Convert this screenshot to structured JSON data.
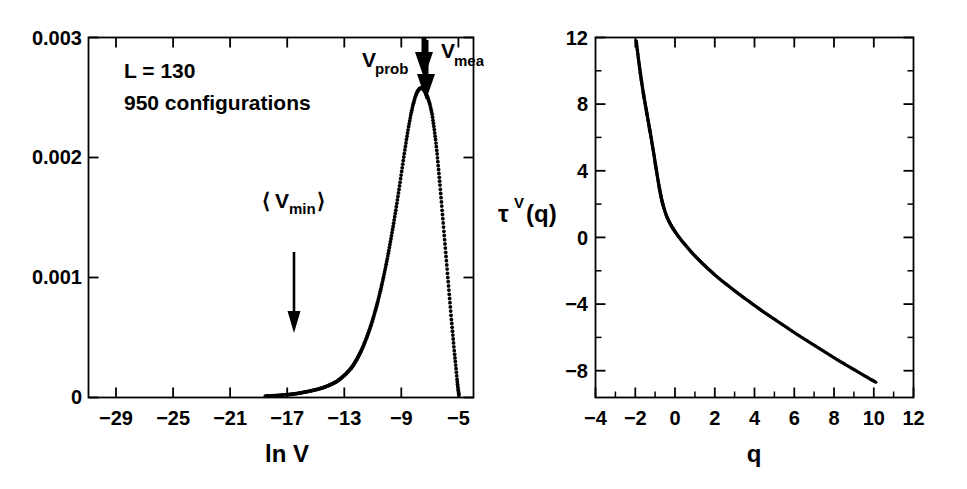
{
  "figure": {
    "background_color": "#ffffff",
    "ink_color": "#000000",
    "panel_count": 2
  },
  "chart_data": [
    {
      "id": "left-panel",
      "type": "scatter",
      "title": "",
      "xlabel": "ln V",
      "ylabel": "",
      "xlim": [
        -31,
        -4
      ],
      "ylim": [
        0,
        0.003
      ],
      "grid": false,
      "legend": "none",
      "xticks": [
        -29,
        -25,
        -21,
        -17,
        -13,
        -9,
        -5
      ],
      "xtick_labels": [
        "−29",
        "−25",
        "−21",
        "−17",
        "−13",
        "−9",
        "−5"
      ],
      "xticks_minor": [
        -27,
        -23,
        -19,
        -15,
        -11,
        -7
      ],
      "yticks": [
        0,
        0.001,
        0.002,
        0.003
      ],
      "ytick_labels": [
        "0",
        "0.001",
        "0.002",
        "0.003"
      ],
      "annotations": [
        {
          "name": "system-size",
          "text": "L = 130"
        },
        {
          "name": "sample-count",
          "text": "950 configurations"
        },
        {
          "name": "vmin-label",
          "text": "⟨V",
          "sub": "min",
          "text_end": "⟩"
        },
        {
          "name": "vprob-label",
          "text": "V",
          "sub": "prob"
        },
        {
          "name": "vmean-label",
          "text": "V",
          "sub": "mean"
        }
      ],
      "arrows": [
        {
          "name": "vmin-arrow",
          "x": -17.0,
          "y_from": 0.00122,
          "y_to": 0.00031,
          "style": "thin"
        },
        {
          "name": "vprob-arrow",
          "x": -7.35,
          "y_from": 0.003,
          "y_to": 0.00266,
          "style": "thick-short"
        },
        {
          "name": "vmean-arrow",
          "x": -7.2,
          "y_from": 0.00297,
          "y_to": 0.00253,
          "style": "thick-long"
        }
      ],
      "series": [
        {
          "name": "P(ln V)",
          "marker": "dot",
          "x": [
            -18.6,
            -18.2,
            -17.8,
            -17.4,
            -17.0,
            -16.7,
            -16.4,
            -16.1,
            -15.8,
            -15.5,
            -15.2,
            -14.9,
            -14.6,
            -14.35,
            -14.1,
            -13.85,
            -13.6,
            -13.4,
            -13.2,
            -13.0,
            -12.8,
            -12.6,
            -12.45,
            -12.3,
            -12.15,
            -12.0,
            -11.85,
            -11.7,
            -11.55,
            -11.4,
            -11.25,
            -11.1,
            -10.95,
            -10.8,
            -10.65,
            -10.5,
            -10.35,
            -10.2,
            -10.05,
            -9.9,
            -9.75,
            -9.6,
            -9.45,
            -9.3,
            -9.15,
            -9.0,
            -8.85,
            -8.7,
            -8.55,
            -8.4,
            -8.25,
            -8.1,
            -7.95,
            -7.8,
            -7.65,
            -7.5,
            -7.35,
            -7.2,
            -7.05,
            -6.9,
            -6.78,
            -6.66,
            -6.55,
            -6.45,
            -6.35,
            -6.25,
            -6.15,
            -6.05,
            -5.95,
            -5.85,
            -5.75,
            -5.65,
            -5.55,
            -5.45,
            -5.35,
            -5.25,
            -5.15,
            -5.08,
            -5.02
          ],
          "y": [
            1.2e-05,
            1.4e-05,
            1.7e-05,
            2.1e-05,
            2.4e-05,
            2.8e-05,
            3.3e-05,
            3.9e-05,
            4.6e-05,
            5.3e-05,
            6.1e-05,
            7e-05,
            8e-05,
            9.1e-05,
            0.000103,
            0.000117,
            0.000133,
            0.00015,
            0.00017,
            0.000191,
            0.000215,
            0.000242,
            0.000266,
            0.000295,
            0.000325,
            0.00036,
            0.000396,
            0.000437,
            0.000481,
            0.000529,
            0.00058,
            0.000636,
            0.000696,
            0.00076,
            0.000829,
            0.000903,
            0.000982,
            0.001066,
            0.001155,
            0.001249,
            0.001348,
            0.001452,
            0.001561,
            0.001675,
            0.001793,
            0.001914,
            0.002034,
            0.00215,
            0.002258,
            0.002354,
            0.002435,
            0.0025,
            0.002546,
            0.002573,
            0.00258,
            0.002568,
            0.00254,
            0.002497,
            0.00244,
            0.00236,
            0.00226,
            0.00215,
            0.00203,
            0.0019,
            0.00177,
            0.00163,
            0.00149,
            0.00135,
            0.00121,
            0.00107,
            0.00093,
            0.00079,
            0.00065,
            0.00052,
            0.00039,
            0.00027,
            0.00015,
            7e-05,
            2e-05
          ]
        }
      ]
    },
    {
      "id": "right-panel",
      "type": "scatter",
      "title": "",
      "xlabel": "q",
      "ylabel": "τ",
      "ylabel_super": "V",
      "ylabel_tail": "(q)",
      "xlim": [
        -4,
        12
      ],
      "ylim": [
        -9.6,
        12
      ],
      "grid": false,
      "legend": "none",
      "xticks": [
        -4,
        -2,
        0,
        2,
        4,
        6,
        8,
        10,
        12
      ],
      "xtick_labels": [
        "−4",
        "−2",
        "0",
        "2",
        "4",
        "6",
        "8",
        "10",
        "12"
      ],
      "xticks_minor": [
        -3,
        -1,
        1,
        3,
        5,
        7,
        9,
        11
      ],
      "yticks": [
        -8,
        -4,
        0,
        4,
        8,
        12
      ],
      "ytick_labels": [
        "−8",
        "−4",
        "0",
        "4",
        "8",
        "12"
      ],
      "yticks_minor": [
        -6,
        -2,
        2,
        6,
        10
      ],
      "series": [
        {
          "name": "tau^V(q)",
          "marker": "dot",
          "x": [
            -1.95,
            -1.9,
            -1.85,
            -1.8,
            -1.75,
            -1.7,
            -1.65,
            -1.6,
            -1.55,
            -1.5,
            -1.45,
            -1.4,
            -1.35,
            -1.3,
            -1.25,
            -1.2,
            -1.15,
            -1.1,
            -1.05,
            -1.0,
            -0.95,
            -0.9,
            -0.85,
            -0.8,
            -0.75,
            -0.7,
            -0.65,
            -0.6,
            -0.5,
            -0.4,
            -0.3,
            -0.2,
            -0.1,
            0.0,
            0.2,
            0.4,
            0.6,
            0.8,
            1.0,
            1.2,
            1.4,
            1.6,
            1.8,
            2.0,
            2.3,
            2.6,
            2.9,
            3.2,
            3.5,
            3.8,
            4.1,
            4.4,
            4.7,
            5.0,
            5.4,
            5.8,
            6.2,
            6.6,
            7.0,
            7.4,
            7.8,
            8.2,
            8.6,
            9.0,
            9.4,
            9.8,
            10.1
          ],
          "y": [
            11.8,
            11.3,
            10.82,
            10.36,
            9.92,
            9.5,
            9.1,
            8.72,
            8.36,
            8.02,
            7.68,
            7.34,
            7.0,
            6.66,
            6.32,
            5.98,
            5.62,
            5.26,
            4.9,
            4.52,
            4.14,
            3.76,
            3.4,
            3.06,
            2.74,
            2.44,
            2.18,
            1.94,
            1.54,
            1.22,
            0.96,
            0.74,
            0.54,
            0.36,
            0.02,
            -0.28,
            -0.56,
            -0.84,
            -1.1,
            -1.34,
            -1.58,
            -1.8,
            -2.02,
            -2.24,
            -2.54,
            -2.82,
            -3.1,
            -3.38,
            -3.64,
            -3.9,
            -4.16,
            -4.42,
            -4.66,
            -4.9,
            -5.22,
            -5.54,
            -5.86,
            -6.16,
            -6.46,
            -6.76,
            -7.06,
            -7.36,
            -7.64,
            -7.92,
            -8.2,
            -8.48,
            -8.68
          ]
        }
      ]
    }
  ],
  "labels": {
    "left": {
      "system_size": "L = 130",
      "config_count": "950 configurations",
      "vmin_open": "⟨",
      "vmin_base": "V",
      "vmin_sub": "min",
      "vmin_close": "⟩",
      "vprob_base": "V",
      "vprob_sub": "prob",
      "vmean_base": "V",
      "vmean_sub": "mean",
      "xaxis_title": "ln V",
      "ytick_0": "0",
      "ytick_1": "0.001",
      "ytick_2": "0.002",
      "ytick_3": "0.003",
      "xtick_m29": "−29",
      "xtick_m25": "−25",
      "xtick_m21": "−21",
      "xtick_m17": "−17",
      "xtick_m13": "−13",
      "xtick_m9": "−9",
      "xtick_m5": "−5"
    },
    "right": {
      "yaxis_tau": "τ",
      "yaxis_super": "V",
      "yaxis_tail": "(q)",
      "xaxis_title": "q",
      "ytick_m8": "−8",
      "ytick_m4": "−4",
      "ytick_0": "0",
      "ytick_4": "4",
      "ytick_8": "8",
      "ytick_12": "12",
      "xtick_m4": "−4",
      "xtick_m2": "−2",
      "xtick_0": "0",
      "xtick_2": "2",
      "xtick_4": "4",
      "xtick_6": "6",
      "xtick_8": "8",
      "xtick_10": "10",
      "xtick_12": "12"
    }
  }
}
